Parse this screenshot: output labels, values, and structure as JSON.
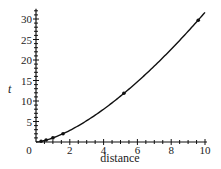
{
  "chart_data": {
    "type": "line",
    "title": "",
    "xlabel": "distance",
    "ylabel": "t",
    "xlim": [
      0,
      10
    ],
    "ylim": [
      0,
      32
    ],
    "x_ticks": [
      0,
      2,
      4,
      6,
      8,
      10
    ],
    "y_ticks": [
      5,
      10,
      15,
      20,
      25,
      30
    ],
    "x_tick_labels": [
      "0",
      "2",
      "4",
      "6",
      "8",
      "10"
    ],
    "y_tick_labels": [
      "5",
      "10",
      "15",
      "20",
      "25",
      "30"
    ],
    "grid": false,
    "legend": null,
    "series": [
      {
        "name": "curve",
        "style": "line",
        "function": "t = distance^1.5",
        "x": [
          0,
          0.5,
          1,
          1.6,
          2,
          3,
          4,
          5,
          5.2,
          6,
          7,
          8,
          9,
          9.6,
          10
        ],
        "values": [
          0,
          0.35,
          1,
          2.02,
          2.83,
          5.2,
          8,
          11.18,
          11.86,
          14.7,
          18.52,
          22.63,
          27,
          29.74,
          31.62
        ]
      },
      {
        "name": "data points",
        "style": "markers",
        "x": [
          0.3,
          0.6,
          1.0,
          1.6,
          5.2,
          9.6
        ],
        "values": [
          0.2,
          0.5,
          1.0,
          2.0,
          11.9,
          29.7
        ]
      }
    ]
  }
}
